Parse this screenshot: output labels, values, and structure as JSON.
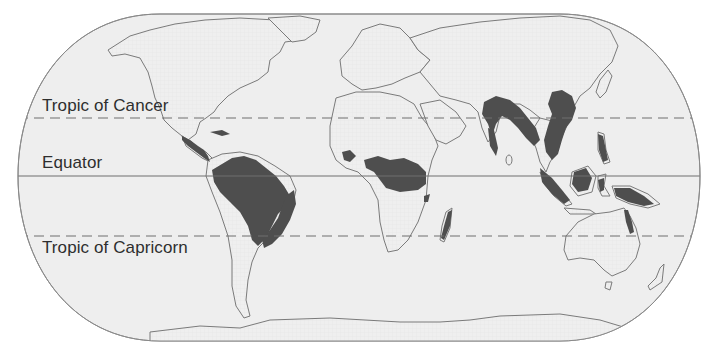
{
  "map": {
    "type": "world-map",
    "projection": "equal-earth / Robinson-like oval",
    "theme": "tropical rainforest distribution",
    "colors": {
      "ocean": "#eeeeee",
      "land": "#eeeeee",
      "coastline": "#7a7a7a",
      "rainforest": "#4e4e4e",
      "border": "#8a8a8a",
      "latitude_line": "#6f6f6f",
      "label_text": "#2e2e2e"
    },
    "latitude_lines": [
      {
        "id": "tropic-of-cancer",
        "label": "Tropic of Cancer",
        "style": "dashed"
      },
      {
        "id": "equator",
        "label": "Equator",
        "style": "solid"
      },
      {
        "id": "tropic-of-capricorn",
        "label": "Tropic of Capricorn",
        "style": "dashed"
      }
    ],
    "shaded_regions": [
      {
        "name": "Central America",
        "continent": "North America"
      },
      {
        "name": "Caribbean islands",
        "continent": "North America"
      },
      {
        "name": "Amazon Basin",
        "continent": "South America"
      },
      {
        "name": "Atlantic Forest (Brazil coast)",
        "continent": "South America"
      },
      {
        "name": "West Africa (Guinea coast)",
        "continent": "Africa"
      },
      {
        "name": "Congo Basin",
        "continent": "Africa"
      },
      {
        "name": "Eastern Madagascar",
        "continent": "Africa"
      },
      {
        "name": "Western Ghats / South Asia",
        "continent": "Asia"
      },
      {
        "name": "Northeast India / Southern China / Indochina",
        "continent": "Asia"
      },
      {
        "name": "Philippines",
        "continent": "Asia"
      },
      {
        "name": "Sumatra / Borneo / Java",
        "continent": "Asia"
      },
      {
        "name": "New Guinea",
        "continent": "Oceania"
      },
      {
        "name": "Northeast Queensland",
        "continent": "Oceania"
      }
    ]
  }
}
